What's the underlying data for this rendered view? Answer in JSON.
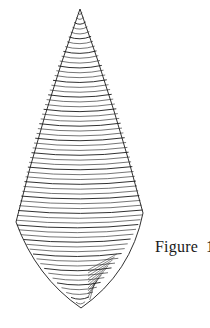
{
  "caption": {
    "label": "Figure",
    "number": "1"
  },
  "shape": {
    "description": "wireframe spindle surface with horizontal contour lines",
    "apex": [
      80,
      9
    ],
    "left_corner": [
      16,
      222
    ],
    "right_corner": [
      143,
      213
    ],
    "bottom_tip": [
      81,
      308
    ],
    "contour_count": 62,
    "stroke_color": "#1a1a1a"
  }
}
